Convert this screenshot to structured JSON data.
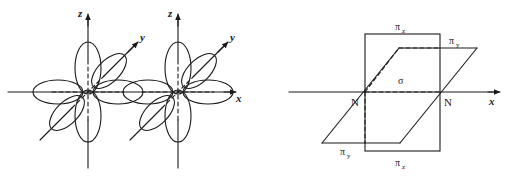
{
  "figure": {
    "name": "nitrogen-orbital-overlap-diagram",
    "stroke_color": "#1a1a1a",
    "background_color": "#ffffff",
    "panels": [
      {
        "id": "left-panel",
        "name": "p-orbital-lobes-panel",
        "description": "Two atomic centers each with six p-orbital lobes along x, y and z axes",
        "axes": [
          {
            "name": "z-axis",
            "label": "z",
            "direction": "vertical-up"
          },
          {
            "name": "y-axis",
            "label": "y",
            "direction": "diagonal-up-right"
          },
          {
            "name": "x-axis",
            "label": "x",
            "direction": "horizontal-right"
          }
        ],
        "atom_count": 2,
        "lobes_per_atom": 6
      },
      {
        "id": "right-panel",
        "name": "bonding-planes-panel",
        "description": "Vertical rectangle pi-z plane and slanted parallelogram pi-y plane crossing at the sigma axis between two N atoms",
        "axes": [
          {
            "name": "x-axis",
            "label": "x",
            "direction": "horizontal-right"
          }
        ],
        "atoms": [
          {
            "name": "nitrogen-left",
            "label": "N"
          },
          {
            "name": "nitrogen-right",
            "label": "N"
          }
        ],
        "orbital_labels": [
          {
            "name": "pi-z-top",
            "base": "π",
            "sub": "z"
          },
          {
            "name": "pi-z-bottom",
            "base": "π",
            "sub": "z"
          },
          {
            "name": "pi-y-top",
            "base": "π",
            "sub": "y"
          },
          {
            "name": "pi-y-bottom",
            "base": "π",
            "sub": "y"
          },
          {
            "name": "sigma",
            "base": "σ",
            "sub": ""
          }
        ]
      }
    ]
  }
}
